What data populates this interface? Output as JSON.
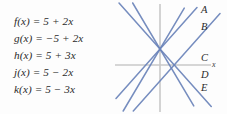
{
  "equations": [
    {
      "name": "f",
      "text": "f(x) = 5 + 2x",
      "lhs": "f(x)",
      "intercept": "5",
      "op": "+",
      "slope": "2x"
    },
    {
      "name": "g",
      "text": "g(x) = −5 + 2x",
      "lhs": "g(x)",
      "intercept": "−5",
      "op": "+",
      "slope": "2x"
    },
    {
      "name": "h",
      "text": "h(x) = 5 + 3x",
      "lhs": "h(x)",
      "intercept": "5",
      "op": "+",
      "slope": "3x"
    },
    {
      "name": "j",
      "text": "j(x) = 5 − 2x",
      "lhs": "j(x)",
      "intercept": "5",
      "op": "−",
      "slope": "2x"
    },
    {
      "name": "k",
      "text": "k(x) = 5 − 3x",
      "lhs": "k(x)",
      "intercept": "5",
      "op": "−",
      "slope": "3x"
    }
  ],
  "graph": {
    "axis_label_x": "x",
    "line_color": "#6b84ba",
    "axis_color": "#c8c8c8",
    "background": "#fdfdfd",
    "labels": [
      {
        "id": "A",
        "text": "A"
      },
      {
        "id": "B",
        "text": "B"
      },
      {
        "id": "C",
        "text": "C"
      },
      {
        "id": "D",
        "text": "D"
      },
      {
        "id": "E",
        "text": "E"
      }
    ]
  },
  "chart_data": {
    "type": "line",
    "title": "",
    "xlabel": "x",
    "ylabel": "",
    "grid": false,
    "legend": "right-endpoint-labels",
    "xlim": [
      -8,
      8
    ],
    "ylim": [
      -11,
      13
    ],
    "axes": {
      "x_axis_y": 0,
      "y_axis_x": 0
    },
    "series": [
      {
        "name": "A",
        "equation": "y = 5 + 3x",
        "slope": 3,
        "intercept": 5,
        "label": "A"
      },
      {
        "name": "B",
        "equation": "y = 5 + 2x",
        "slope": 2,
        "intercept": 5,
        "label": "B"
      },
      {
        "name": "C",
        "equation": "y = -5 + 2x",
        "slope": 2,
        "intercept": -5,
        "label": "C"
      },
      {
        "name": "D",
        "equation": "y = 5 - 2x",
        "slope": -2,
        "intercept": 5,
        "label": "D"
      },
      {
        "name": "E",
        "equation": "y = 5 - 3x",
        "slope": -3,
        "intercept": 5,
        "label": "E"
      }
    ]
  }
}
